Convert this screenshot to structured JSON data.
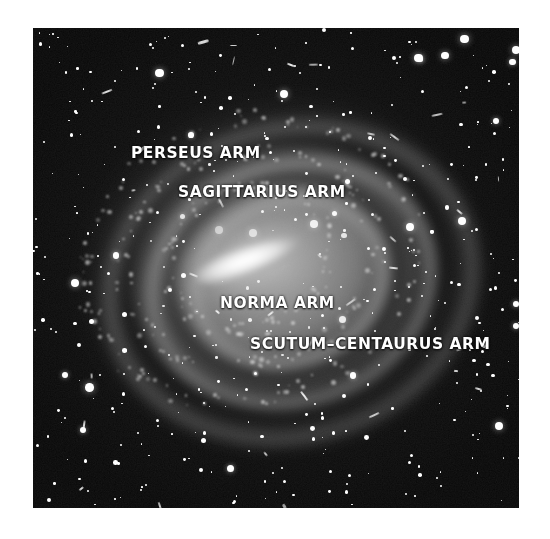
{
  "figure": {
    "kind": "astronomical-photograph",
    "palette": "grayscale",
    "background_color": "#ffffff",
    "sky_color": "#070707",
    "label_color": "#ffffff",
    "frame": {
      "x": 33,
      "y": 28,
      "width": 486,
      "height": 480
    }
  },
  "labels": [
    {
      "id": "perseus",
      "text": "PERSEUS ARM"
    },
    {
      "id": "sagittarius",
      "text": "SAGITTARIUS ARM"
    },
    {
      "id": "norma",
      "text": "NORMA ARM"
    },
    {
      "id": "scutum",
      "text": "SCUTUM–CENTAURUS ARM"
    }
  ],
  "structures": {
    "nucleus_bar": "central bright elongated bar",
    "arms": [
      "outer arm band",
      "middle arm band",
      "inner arm band"
    ],
    "dust_lanes": [
      "outer dust lane",
      "inner dust lane"
    ],
    "halo": "diffuse outer halo"
  }
}
